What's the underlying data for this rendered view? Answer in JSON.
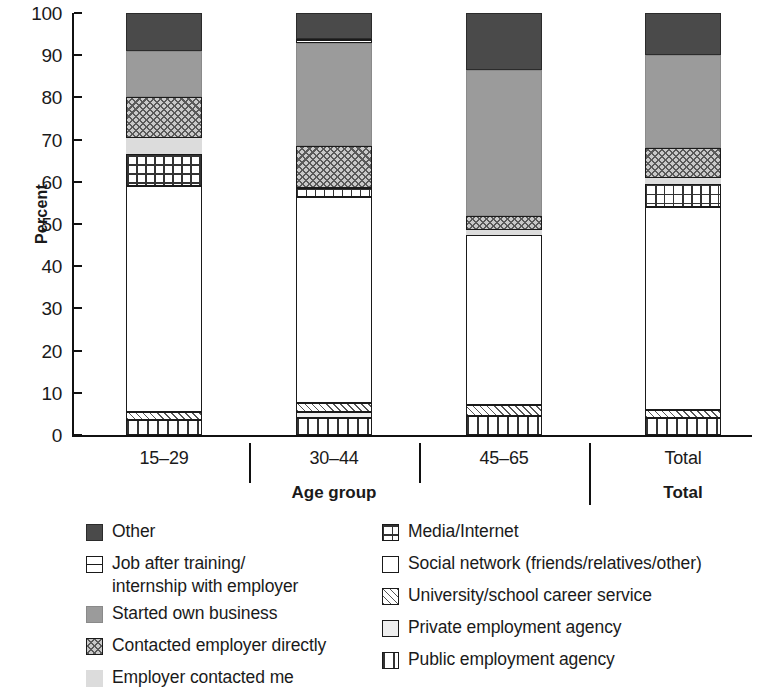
{
  "chart_data": {
    "type": "bar",
    "subtype": "stacked-bar-100percent",
    "title": "",
    "xlabel": "Age group",
    "ylabel": "Percent",
    "ylim": [
      0,
      100
    ],
    "yticks": [
      0,
      10,
      20,
      30,
      40,
      50,
      60,
      70,
      80,
      90,
      100
    ],
    "ytick_labels": [
      "0",
      "10",
      "20",
      "30",
      "40",
      "50",
      "60",
      "70",
      "80",
      "90",
      "100"
    ],
    "grid": false,
    "legend_position": "bottom",
    "categories": [
      "15–29",
      "30–44",
      "45–65",
      "Total"
    ],
    "category_group_labels": [
      "Age group",
      "Total"
    ],
    "series": [
      {
        "name": "Public employment agency",
        "pattern": "vertical-stripes",
        "values": [
          3.5,
          4.0,
          4.5,
          4.0
        ]
      },
      {
        "name": "Private employment agency",
        "pattern": "light-solid",
        "values": [
          0.0,
          1.5,
          0.0,
          0.0
        ]
      },
      {
        "name": "University/school career service",
        "pattern": "diagonal-stripes",
        "values": [
          2.0,
          2.0,
          2.5,
          2.0
        ]
      },
      {
        "name": "Social network (friends/relatives/other)",
        "pattern": "white",
        "values": [
          53.5,
          49.0,
          40.5,
          48.0
        ]
      },
      {
        "name": "Media/Internet",
        "pattern": "grid",
        "values": [
          7.5,
          2.0,
          0.0,
          5.5
        ]
      },
      {
        "name": "Employer contacted me",
        "pattern": "light-gray-solid",
        "values": [
          4.0,
          0.0,
          1.0,
          1.5
        ]
      },
      {
        "name": "Contacted employer directly",
        "pattern": "checkered",
        "values": [
          9.5,
          10.0,
          3.5,
          7.0
        ]
      },
      {
        "name": "Started own business",
        "pattern": "mid-gray-solid",
        "values": [
          11.0,
          24.5,
          34.5,
          22.0
        ]
      },
      {
        "name": "Job after training/internship with employer",
        "pattern": "horizontal-line-box",
        "values": [
          0.0,
          0.8,
          0.0,
          0.0
        ]
      },
      {
        "name": "Other",
        "pattern": "dark-gray-solid",
        "values": [
          9.0,
          6.2,
          13.5,
          10.0
        ]
      }
    ],
    "cumulative_tops": {
      "15–29": [
        3.5,
        3.5,
        5.5,
        59.0,
        66.5,
        70.5,
        80.0,
        91.0,
        91.0,
        100.0
      ],
      "30–44": [
        4.0,
        5.5,
        7.5,
        56.5,
        58.5,
        58.5,
        68.5,
        93.0,
        93.8,
        100.0
      ],
      "45–65": [
        4.5,
        4.5,
        7.0,
        47.5,
        47.5,
        48.5,
        52.0,
        86.5,
        86.5,
        100.0
      ],
      "Total": [
        4.0,
        4.0,
        6.0,
        54.0,
        59.5,
        61.0,
        68.0,
        90.0,
        90.0,
        100.0
      ]
    }
  },
  "axis": {
    "y_title": "Percent",
    "y_ticks": [
      "100",
      "90",
      "80",
      "70",
      "60",
      "50",
      "40",
      "30",
      "20",
      "10",
      "0"
    ],
    "x_categories": [
      "15–29",
      "30–44",
      "45–65"
    ],
    "x_group_title": "Age group",
    "x_total_label": "Total"
  },
  "legend": {
    "left_column": [
      {
        "label": "Other",
        "swatch": "dark-gray-solid-swatch"
      },
      {
        "label": "Job after training/\ninternship with employer",
        "swatch": "horizontal-line-box-swatch"
      },
      {
        "label": "Started own business",
        "swatch": "mid-gray-solid-swatch"
      },
      {
        "label": "Contacted employer directly",
        "swatch": "checkered-swatch"
      },
      {
        "label": "Employer contacted me",
        "swatch": "light-gray-solid-swatch"
      }
    ],
    "right_column": [
      {
        "label": "Media/Internet",
        "swatch": "grid-swatch"
      },
      {
        "label": "Social network (friends/relatives/other)",
        "swatch": "white-swatch"
      },
      {
        "label": "University/school career service",
        "swatch": "diagonal-stripes-swatch"
      },
      {
        "label": "Private employment agency",
        "swatch": "light-solid-swatch"
      },
      {
        "label": "Public employment agency",
        "swatch": "vertical-stripes-swatch"
      }
    ]
  },
  "colors": {
    "other": "#4a4a4a",
    "started_own_business": "#9b9b9b",
    "employer_contacted_me": "#dcdcdc",
    "contacted_employer_directly": "#c9c9c9",
    "private_employment_agency": "#efefef",
    "axis": "#111111",
    "background": "#ffffff"
  }
}
